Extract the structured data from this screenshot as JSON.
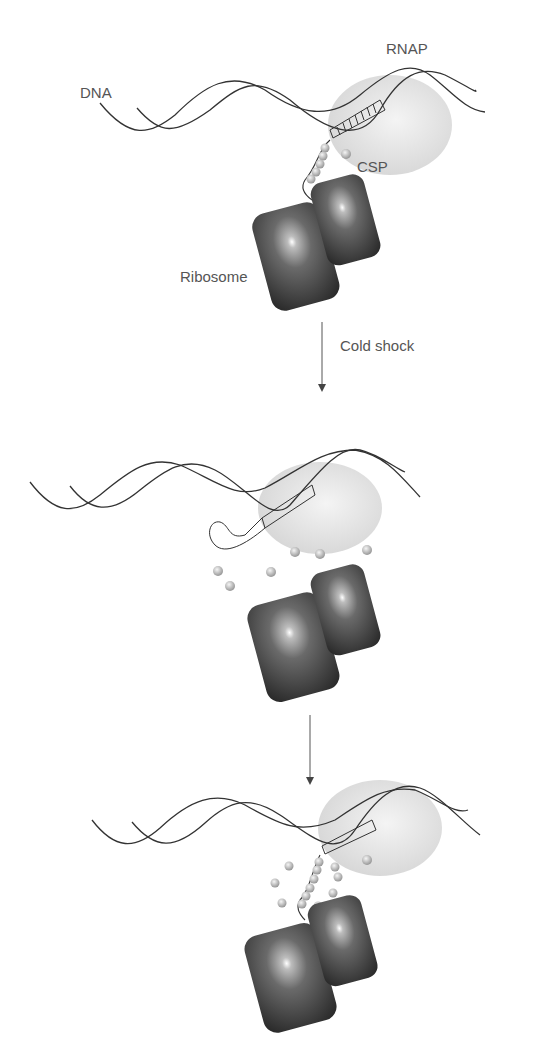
{
  "diagram": {
    "labels": {
      "dna": "DNA",
      "rnap": "RNAP",
      "csp": "CSP",
      "ribosome": "Ribosome",
      "step1_arrow": "Cold shock",
      "step2_arrow": ""
    },
    "panels": [
      {
        "name": "normal",
        "description": "Transcription-translation coupled; CSP bound to mRNA"
      },
      {
        "name": "after-cold-shock",
        "description": "mRNA forms secondary structure; CSPs dissociated"
      },
      {
        "name": "recovery",
        "description": "CSPs bind mRNA, unfolding secondary structure"
      }
    ],
    "colors": {
      "line": "#333333",
      "rnap": "#dcdcdc",
      "ribosome": "#3a3a3a",
      "csp": "#b5b5b5",
      "text": "#555555"
    }
  }
}
